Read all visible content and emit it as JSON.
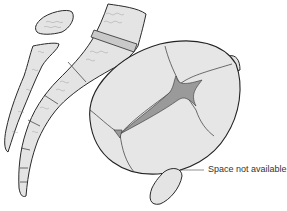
{
  "diagram": {
    "annotations": [
      {
        "id": "space-label",
        "text": "Space not available"
      }
    ],
    "colors": {
      "bone_fill": "#e4e4e4",
      "fontanelle_fill": "#9a9a9a",
      "outline": "#2a2a2a",
      "background": "#ffffff"
    }
  }
}
